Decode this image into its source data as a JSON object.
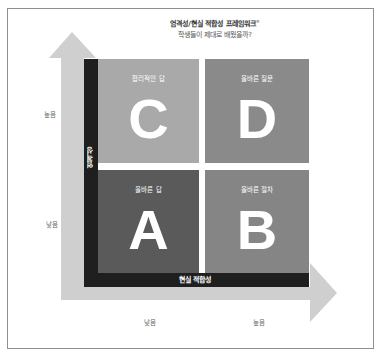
{
  "header": {
    "title": "엄격성/현실 적합성 프레임워크",
    "title_mark": "®",
    "subtitle": "학생들이 제대로 배웠을까?"
  },
  "axes": {
    "y": {
      "label": "엄격성",
      "high": "높음",
      "low": "낮음"
    },
    "x": {
      "label": "현실 적합성",
      "low": "낮음",
      "high": "높음"
    }
  },
  "quadrants": [
    {
      "id": "C",
      "letter": "C",
      "label": "합리적인 답",
      "position": "top-left",
      "color": "#a9a9a9"
    },
    {
      "id": "D",
      "letter": "D",
      "label": "올바른 질문",
      "position": "top-right",
      "color": "#8a8a8a"
    },
    {
      "id": "A",
      "letter": "A",
      "label": "올바른 답",
      "position": "bottom-left",
      "color": "#5a5a5a"
    },
    {
      "id": "B",
      "letter": "B",
      "label": "올바른 절차",
      "position": "bottom-right",
      "color": "#858585"
    }
  ],
  "colors": {
    "axis_bar": "#1f1f1f",
    "arrow": "#cfcfcf",
    "frame_border": "#8f8f8f"
  }
}
